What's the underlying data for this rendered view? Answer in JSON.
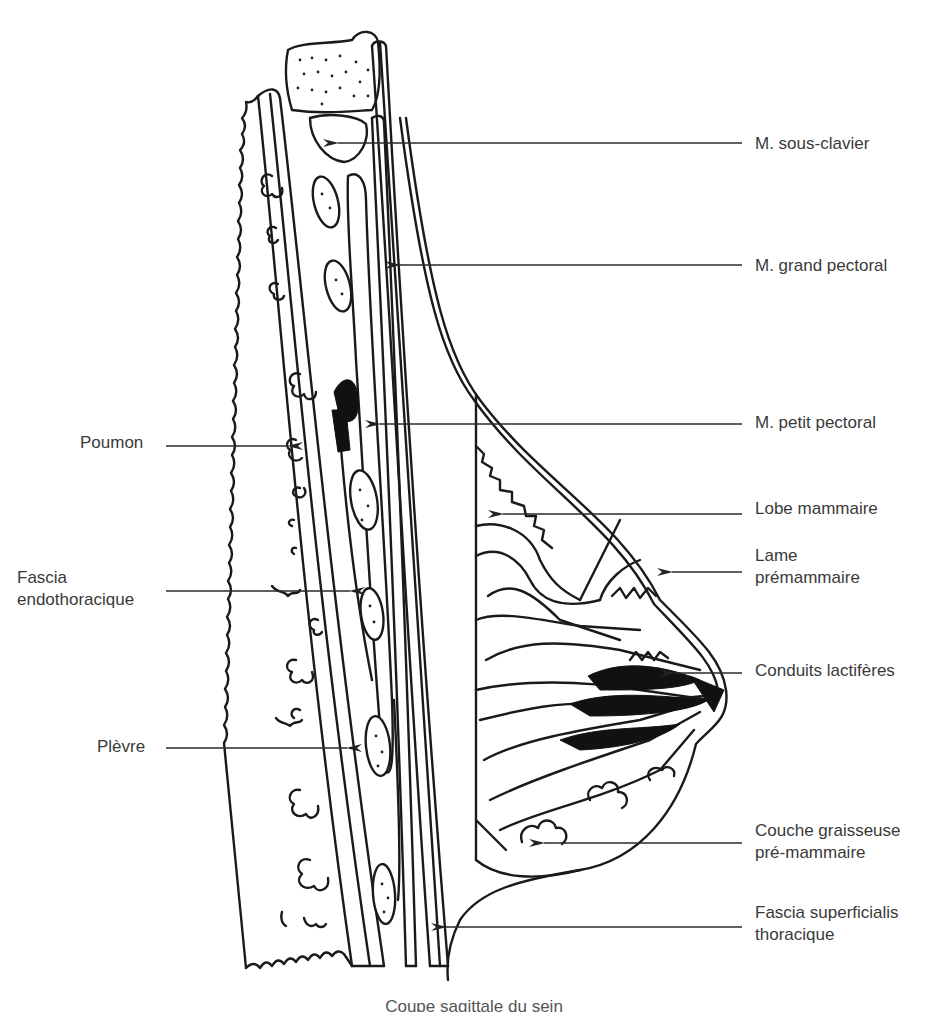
{
  "figure": {
    "type": "anatomical-line-drawing",
    "subject": "Coupe sagittale du sein"
  },
  "labels_right": [
    {
      "id": "sous-clavier",
      "lines": [
        "M. sous-clavier"
      ],
      "x": 755,
      "y": 133,
      "arrow": {
        "from": 742,
        "to": 338,
        "y": 143
      }
    },
    {
      "id": "grand-pectoral",
      "lines": [
        "M. grand pectoral"
      ],
      "x": 755,
      "y": 255,
      "arrow": {
        "from": 742,
        "to": 400,
        "y": 265
      }
    },
    {
      "id": "petit-pectoral",
      "lines": [
        "M. petit pectoral"
      ],
      "x": 755,
      "y": 412,
      "arrow": {
        "from": 742,
        "to": 380,
        "y": 424
      }
    },
    {
      "id": "lobe-mammaire",
      "lines": [
        "Lobe mammaire"
      ],
      "x": 755,
      "y": 498,
      "arrow": {
        "from": 742,
        "to": 503,
        "y": 514
      }
    },
    {
      "id": "lame-premammaire",
      "lines": [
        "Lame",
        "prémammaire"
      ],
      "x": 755,
      "y": 556,
      "arrow": {
        "from": 742,
        "to": 672,
        "y": 572
      }
    },
    {
      "id": "conduits-lactiferes",
      "lines": [
        "Conduits lactifères"
      ],
      "x": 755,
      "y": 660,
      "arrow": {
        "from": 742,
        "to": 675,
        "y": 673
      }
    },
    {
      "id": "couche-graisseuse",
      "lines": [
        "Couche graisseuse",
        "pré-mammaire"
      ],
      "x": 755,
      "y": 817,
      "arrow": {
        "from": 742,
        "to": 544,
        "y": 843
      }
    },
    {
      "id": "fascia-superficialis",
      "lines": [
        "Fascia superficialis",
        "thoracique"
      ],
      "x": 755,
      "y": 896,
      "arrow": {
        "from": 742,
        "to": 446,
        "y": 927
      }
    }
  ],
  "labels_left": [
    {
      "id": "poumon",
      "lines": [
        "Poumon"
      ],
      "x": 80,
      "y": 432,
      "arrow": {
        "from": 166,
        "to": 288,
        "y": 446
      }
    },
    {
      "id": "fascia-endothoracique",
      "lines": [
        "Fascia",
        "endothoracique"
      ],
      "x": 17,
      "y": 567,
      "arrow": {
        "from": 166,
        "to": 350,
        "y": 591
      }
    },
    {
      "id": "plevre",
      "lines": [
        "Plèvre"
      ],
      "x": 97,
      "y": 734,
      "arrow": {
        "from": 166,
        "to": 347,
        "y": 748
      }
    }
  ],
  "caption": "Coupe sagittale du sein"
}
